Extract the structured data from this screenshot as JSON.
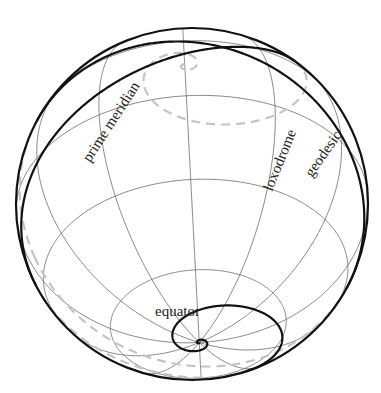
{
  "figure": {
    "type": "sphere-diagram",
    "labels": {
      "prime_meridian": "prime meridian",
      "loxodrome": "loxodrome",
      "geodesic": "geodesic",
      "equator": "equator"
    },
    "graticule": {
      "meridian_step_deg": 30,
      "parallels_deg": [
        60,
        30,
        0,
        -30,
        -60
      ]
    },
    "curves": [
      {
        "name": "loxodrome",
        "style": "solid-front dashed-back",
        "spirals_to": "north pole and south pole"
      },
      {
        "name": "geodesic",
        "style": "solid-front dashed-back",
        "kind": "great circle"
      }
    ],
    "colors": {
      "curve": "#111111",
      "hidden_curve": "#c4c4c4",
      "grid": "#6b6b6b",
      "background": "#ffffff"
    }
  }
}
